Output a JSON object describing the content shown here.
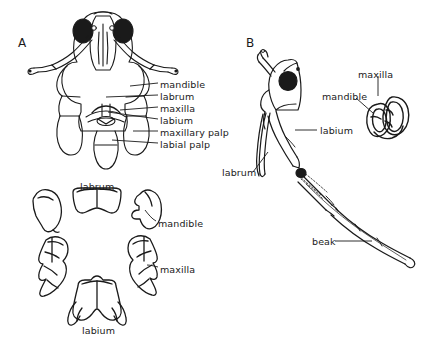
{
  "figure": {
    "background_color": "#ffffff",
    "ink_color": "#1a1a1a",
    "panels": [
      {
        "letter": "A",
        "x": 18,
        "y": 36
      },
      {
        "letter": "B",
        "x": 246,
        "y": 36
      }
    ]
  },
  "panel_a": {
    "letter": "A",
    "subject": "ventral view of hemipteran head with mouthparts",
    "callout_labels": [
      {
        "text": "mandible",
        "x": 160,
        "y": 80,
        "leader_from": [
          158,
          83
        ],
        "leader_to": [
          130,
          86
        ]
      },
      {
        "text": "labrum",
        "x": 160,
        "y": 92,
        "leader_from": [
          158,
          95
        ],
        "leader_to": [
          106,
          97
        ]
      },
      {
        "text": "maxilla",
        "x": 160,
        "y": 104,
        "leader_from": [
          158,
          107
        ],
        "leader_to": [
          120,
          110
        ]
      },
      {
        "text": "labium",
        "x": 160,
        "y": 116,
        "leader_from": [
          158,
          119
        ],
        "leader_to": [
          108,
          112
        ]
      },
      {
        "text": "maxillary palp",
        "x": 160,
        "y": 128,
        "leader_from": [
          158,
          131
        ],
        "leader_to": [
          133,
          131
        ]
      },
      {
        "text": "labial palp",
        "x": 160,
        "y": 140,
        "leader_from": [
          158,
          143
        ],
        "leader_to": [
          112,
          140
        ]
      }
    ]
  },
  "panel_a_detached": {
    "subject": "separated mouthpart sclerites",
    "labels": [
      {
        "text": "labrum",
        "x": 80,
        "y": 182
      },
      {
        "text": "mandible",
        "x": 158,
        "y": 219
      },
      {
        "text": "maxilla",
        "x": 160,
        "y": 265
      },
      {
        "text": "labium",
        "x": 82,
        "y": 326
      }
    ]
  },
  "panel_b": {
    "letter": "B",
    "subject": "lateral view of hemipteran head with extended beak",
    "labels": [
      {
        "text": "maxilla",
        "x": 358,
        "y": 70,
        "leader_from": [
          375,
          76
        ],
        "leader_to": [
          375,
          96
        ]
      },
      {
        "text": "mandible",
        "x": 322,
        "y": 92,
        "leader_from": [
          356,
          98
        ],
        "leader_to": [
          372,
          113
        ]
      },
      {
        "text": "labium",
        "x": 320,
        "y": 126,
        "leader_from": [
          317,
          130
        ],
        "leader_to": [
          295,
          130
        ]
      },
      {
        "text": "labrum",
        "x": 222,
        "y": 168,
        "leader_from": [
          253,
          172
        ],
        "leader_to": [
          268,
          152
        ]
      },
      {
        "text": "beak",
        "x": 312,
        "y": 237,
        "leader_from": [
          335,
          241
        ],
        "leader_to": [
          372,
          241
        ]
      }
    ]
  }
}
